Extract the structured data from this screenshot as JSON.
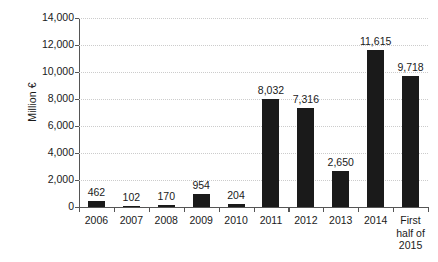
{
  "chart_data": {
    "type": "bar",
    "title": "",
    "xlabel": "",
    "ylabel": "Million €",
    "categories": [
      "2006",
      "2007",
      "2008",
      "2009",
      "2010",
      "2011",
      "2012",
      "2013",
      "2014",
      "First half of 2015"
    ],
    "category_lines": [
      [
        "2006"
      ],
      [
        "2007"
      ],
      [
        "2008"
      ],
      [
        "2009"
      ],
      [
        "2010"
      ],
      [
        "2011"
      ],
      [
        "2012"
      ],
      [
        "2013"
      ],
      [
        "2014"
      ],
      [
        "First",
        "half of",
        "2015"
      ]
    ],
    "values": [
      462,
      102,
      170,
      954,
      204,
      8032,
      7316,
      2650,
      11615,
      9718
    ],
    "value_labels": [
      "462",
      "102",
      "170",
      "954",
      "204",
      "8,032",
      "7,316",
      "2,650",
      "11,615",
      "9,718"
    ],
    "ylim": [
      0,
      14000
    ],
    "yticks": [
      0,
      2000,
      4000,
      6000,
      8000,
      10000,
      12000,
      14000
    ],
    "ytick_labels": [
      "0",
      "2,000",
      "4,000",
      "6,000",
      "8,000",
      "10,000",
      "12,000",
      "14,000"
    ],
    "grid": true,
    "grid_axis": "y",
    "legend": "none",
    "bar_color": "#1a1a1a",
    "grid_color": "#cccccc",
    "axis_color": "#555555"
  }
}
